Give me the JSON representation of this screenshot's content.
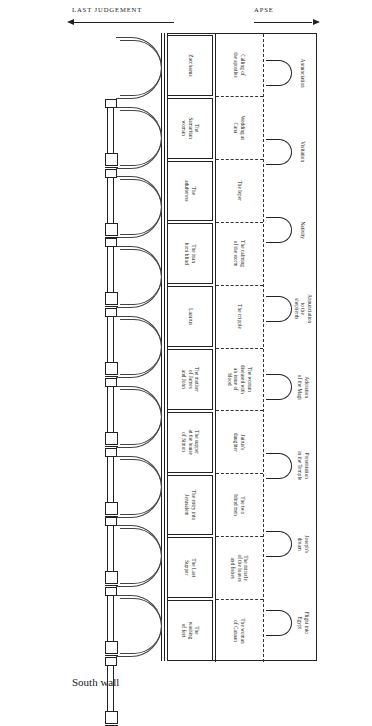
{
  "diagram": {
    "orientation_note": "rotated elevation",
    "annotations": {
      "apse": "APSE",
      "last_judgement": "LAST JUDGEMENT",
      "south_wall": "South wall"
    }
  },
  "registers": [
    {
      "name": "upper-register-infancy",
      "separator": "none",
      "scenes": [
        "Annunciation",
        "Visitation",
        "Nativity",
        "Annunciation\nto the\nshepherds",
        "Adoration\nof the Magi",
        "Presentation\nin the Temple",
        "Joseph's\ndream",
        "Flight into\nEgypt"
      ]
    },
    {
      "name": "middle-register-miracles",
      "separator": "dashed",
      "scenes": [
        "Calling of\nthe apostles",
        "Wedding at\nCana",
        "The leper",
        "The calming\nof the storm",
        "The cripple",
        "The woman\ndiseased with\nan issue of\nblood",
        "Jairus's\ndaughter",
        "The two\nblind men",
        "The miracle\nof the loaves\nand fishes",
        "The woman\nof Canaan"
      ]
    },
    {
      "name": "lower-register-ministry",
      "separator": "solid",
      "scenes": [
        "Zacchaeus",
        "The\nSamaritan\nwoman",
        "The\nadulteress",
        "The man\nborn blind",
        "Lazarus",
        "The mother\nof James\nand John",
        "The supper\nat the house\nof Simon",
        "The entry into\nJerusalem",
        "The Last\nSupper",
        "The\nwashing\nof feet"
      ]
    }
  ],
  "arcade": {
    "bay_count": 9,
    "column_count": 9,
    "column_parts": [
      "capital",
      "shaft",
      "base"
    ]
  },
  "windows": {
    "count": 8,
    "shape": "round-headed arch"
  }
}
